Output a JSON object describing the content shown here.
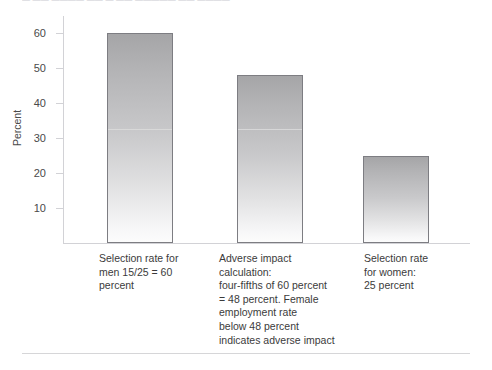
{
  "top_clipped_text": "— —— ———— —— — —— ————— —— ————",
  "colors": {
    "bar_top": "#a5a5a7",
    "bar_bottom": "#fcfcfc",
    "bar_border": "#7d7d82",
    "axis": "#d2d2d6",
    "text": "#3b3b3b"
  },
  "chart_data": {
    "type": "bar",
    "title": "",
    "xlabel": "",
    "ylabel": "Percent",
    "ylim": [
      0,
      65
    ],
    "yticks": [
      10,
      20,
      30,
      40,
      50,
      60
    ],
    "ytick_labels": [
      "10",
      "20",
      "30",
      "40",
      "50",
      "60"
    ],
    "grid": false,
    "legend": "none",
    "categories": [
      "Selection rate for men 15/25 = 60 percent",
      "Adverse impact calculation: four-fifths of 60 percent = 48 percent. Female employment rate below 48 percent indicates adverse impact",
      "Selection rate for women: 25 percent"
    ],
    "values": [
      60,
      48,
      25
    ],
    "bars": [
      {
        "value": 60,
        "label_lines": [
          "Selection rate for",
          "men 15/25 = 60",
          "percent"
        ],
        "band_line_value": 32
      },
      {
        "value": 48,
        "label_lines": [
          "Adverse impact",
          "calculation:",
          "four-fifths of 60 percent",
          "= 48 percent. Female",
          "employment rate",
          "below 48 percent",
          "indicates adverse impact"
        ],
        "band_line_value": 32
      },
      {
        "value": 25,
        "label_lines": [
          "Selection rate",
          "for women:",
          "25 percent"
        ],
        "band_line_value": null
      }
    ]
  }
}
